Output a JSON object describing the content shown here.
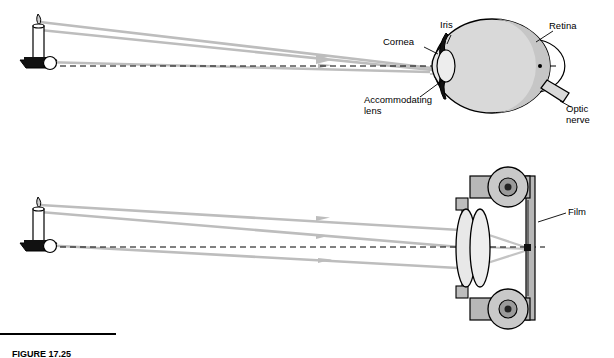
{
  "figure": {
    "caption_label": "FIGURE 17.25",
    "caption_text": ""
  },
  "labels": {
    "cornea": "Cornea",
    "iris": "Iris",
    "retina": "Retina",
    "accommodating_lens": "Accommodating\nlens",
    "optic_nerve": "Optic\nnerve",
    "film": "Film"
  },
  "colors": {
    "ray": "#b9b9b9",
    "outline": "#000000",
    "eye_fill": "#d8d8d8",
    "lens_fill": "#e9e9e9",
    "iris_fill": "#1a1a1a",
    "camera_body": "#b5b5b5",
    "dashed_axis": "#000000",
    "candle_flame": "#cccccc",
    "background": "#ffffff"
  },
  "diagram": {
    "top_panel_name": "human-eye-optics",
    "bottom_panel_name": "camera-optics",
    "object_name": "candle-on-holder",
    "ray_count": 3
  }
}
